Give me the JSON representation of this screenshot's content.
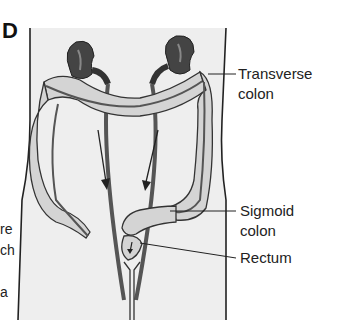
{
  "figure": {
    "panel_letter": "D",
    "left_text_fragments": [
      "re",
      "ch",
      "a"
    ],
    "labels": [
      {
        "id": "transverse-colon",
        "line1": "Transverse",
        "line2": "colon"
      },
      {
        "id": "sigmoid-colon",
        "line1": "Sigmoid",
        "line2": "colon"
      },
      {
        "id": "rectum",
        "line1": "Rectum",
        "line2": ""
      }
    ],
    "colors": {
      "background": "#ffffff",
      "body_fill": "#eeeeee",
      "outline": "#222222",
      "colon_fill": "#d4d4d4",
      "kidney_fill": "#444444",
      "vessel": "#666666"
    }
  }
}
